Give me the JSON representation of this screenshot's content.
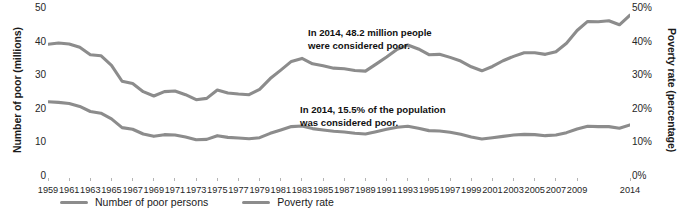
{
  "chart_data": {
    "type": "line",
    "title": "",
    "xlabel": "",
    "ylabel": "Number of poor (millions)",
    "y2label": "Poverty rate (percentage)",
    "grid": false,
    "legend_position": "bottom-left",
    "ylim": [
      0,
      50
    ],
    "y2lim": [
      0,
      50
    ],
    "yticks": [
      "0",
      "10",
      "20",
      "30",
      "40",
      "50"
    ],
    "ytick_values": [
      0,
      10,
      20,
      30,
      40,
      50
    ],
    "y2ticks": [
      "0%",
      "10%",
      "20%",
      "30%",
      "40%",
      "50%"
    ],
    "y2tick_values": [
      0,
      10,
      20,
      30,
      40,
      50
    ],
    "x": [
      1959,
      1960,
      1961,
      1962,
      1963,
      1964,
      1965,
      1966,
      1967,
      1968,
      1969,
      1970,
      1971,
      1972,
      1973,
      1974,
      1975,
      1976,
      1977,
      1978,
      1979,
      1980,
      1981,
      1982,
      1983,
      1984,
      1985,
      1986,
      1987,
      1988,
      1989,
      1990,
      1991,
      1992,
      1993,
      1994,
      1995,
      1996,
      1997,
      1998,
      1999,
      2000,
      2001,
      2002,
      2003,
      2004,
      2005,
      2006,
      2007,
      2008,
      2009,
      2010,
      2011,
      2012,
      2013,
      2014
    ],
    "xtick_labels": [
      "1959",
      "1961",
      "1963",
      "1965",
      "1967",
      "1969",
      "1971",
      "1973",
      "1975",
      "1977",
      "1979",
      "1981",
      "1983",
      "1985",
      "1987",
      "1989",
      "1991",
      "1993",
      "1995",
      "1997",
      "1999",
      "2001",
      "2003",
      "2005",
      "2007",
      "2009",
      "2014"
    ],
    "xtick_values": [
      1959,
      1961,
      1963,
      1965,
      1967,
      1969,
      1971,
      1973,
      1975,
      1977,
      1979,
      1981,
      1983,
      1985,
      1987,
      1989,
      1991,
      1993,
      1995,
      1997,
      1999,
      2001,
      2003,
      2005,
      2007,
      2009,
      2014
    ],
    "series": [
      {
        "name": "Number of poor persons",
        "units": "millions",
        "axis": "left",
        "color": "#8c8c8c",
        "values": [
          39.5,
          39.9,
          39.6,
          38.6,
          36.4,
          36.1,
          33.2,
          28.5,
          27.8,
          25.4,
          24.1,
          25.4,
          25.6,
          24.5,
          23.0,
          23.4,
          25.9,
          25.0,
          24.7,
          24.5,
          26.1,
          29.3,
          31.8,
          34.4,
          35.3,
          33.7,
          33.1,
          32.4,
          32.2,
          31.7,
          31.5,
          33.6,
          35.7,
          38.0,
          39.3,
          38.1,
          36.4,
          36.5,
          35.6,
          34.5,
          32.8,
          31.6,
          32.9,
          34.6,
          35.9,
          37.0,
          37.0,
          36.5,
          37.3,
          39.8,
          43.6,
          46.3,
          46.2,
          46.5,
          45.3,
          48.2
        ]
      },
      {
        "name": "Poverty rate",
        "units": "percent",
        "axis": "right",
        "color": "#8c8c8c",
        "values": [
          22.4,
          22.2,
          21.9,
          21.0,
          19.5,
          19.0,
          17.3,
          14.7,
          14.2,
          12.8,
          12.1,
          12.6,
          12.5,
          11.9,
          11.1,
          11.2,
          12.3,
          11.8,
          11.6,
          11.4,
          11.7,
          13.0,
          14.0,
          15.0,
          15.2,
          14.4,
          14.0,
          13.6,
          13.4,
          13.0,
          12.8,
          13.5,
          14.2,
          14.8,
          15.1,
          14.5,
          13.8,
          13.7,
          13.3,
          12.7,
          11.9,
          11.3,
          11.7,
          12.1,
          12.5,
          12.7,
          12.6,
          12.3,
          12.5,
          13.2,
          14.3,
          15.1,
          15.0,
          15.0,
          14.5,
          15.5
        ]
      }
    ],
    "annotations": [
      {
        "id": "count",
        "text": "In 2014, 48.2 million people\nwere considered poor.",
        "line1": "In 2014, 48.2 million people",
        "line2": "were considered poor."
      },
      {
        "id": "rate",
        "text": "In 2014, 15.5% of the population\nwas considered poor.",
        "line1": "In 2014, 15.5% of the population",
        "line2": "was considered poor."
      }
    ]
  },
  "legend": {
    "items": [
      {
        "label": "Number of poor persons",
        "color": "#8c8c8c"
      },
      {
        "label": "Poverty rate",
        "color": "#8c8c8c"
      }
    ]
  },
  "colors": {
    "line": "#8c8c8c",
    "text": "#1a1a1a",
    "background": "#ffffff"
  }
}
